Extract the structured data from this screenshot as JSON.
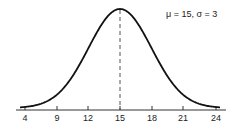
{
  "chart_data": {
    "type": "line",
    "title": "",
    "xlabel": "",
    "ylabel": "",
    "annotation": "μ = 15,  σ = 3",
    "mu": 15,
    "sigma": 3,
    "x_ticks": [
      4,
      9,
      12,
      15,
      18,
      21,
      24
    ],
    "x_tick_labels": [
      "4",
      "9",
      "12",
      "15",
      "18",
      "21",
      "24"
    ],
    "xlim": [
      3.5,
      25
    ],
    "mean_line": {
      "x": 15,
      "style": "dashed"
    },
    "grid": false,
    "series": [
      {
        "name": "Normal density",
        "x": [
          6,
          9,
          12,
          15,
          18,
          21,
          24
        ],
        "values": [
          0.0015,
          0.018,
          0.081,
          0.133,
          0.081,
          0.018,
          0.0015
        ]
      }
    ]
  },
  "labels": {
    "annotation": "μ = 15,  σ = 3"
  },
  "colors": {
    "curve": "#111111",
    "axis": "#333333",
    "mean_line": "#555555"
  }
}
